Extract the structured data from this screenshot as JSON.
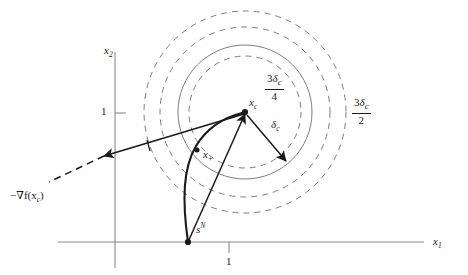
{
  "figure": {
    "type": "diagram",
    "width": 468,
    "height": 275,
    "background_color": "#ffffff",
    "ink_color": "#1a1a1a",
    "axis_color": "#8a8a8a",
    "circle_color": "#7d7d7d"
  },
  "axes": {
    "x_axis": {
      "label": "x",
      "label_sub": "1",
      "tick_label": "1"
    },
    "y_axis": {
      "label": "x",
      "label_sub": "2",
      "tick_label": "1"
    }
  },
  "points": {
    "center": {
      "name": "x_c",
      "label": "x",
      "label_sub": "c",
      "x": 245,
      "y": 112
    },
    "next_iterate": {
      "name": "x_plus",
      "label": "x",
      "label_sub": "+",
      "x": 201,
      "y": 160
    },
    "newton_point": {
      "name": "newton-step-endpoint",
      "x": 188,
      "y": 242
    }
  },
  "vectors": {
    "delta_c": {
      "label": "δ",
      "label_sub": "c",
      "description": "trust region radius arrow from x_c"
    },
    "neg_gradient": {
      "label": "−∇f(x",
      "label_sub": "c",
      "label_tail": ")",
      "description": "negative gradient / steepest descent direction arrow"
    },
    "newton_step": {
      "label": "s",
      "label_sup": "N",
      "description": "Newton step vector from x_c"
    }
  },
  "circles": [
    {
      "name": "delta-c-circle",
      "style": "dashed",
      "radius_label": "δc",
      "radius_px": 56
    },
    {
      "name": "three-delta-c-over-4-circle",
      "style": "solid",
      "numerator_coef": "3",
      "numerator_sym": "δ",
      "numerator_sub": "c",
      "denominator": "4",
      "radius_px": 67
    },
    {
      "name": "outer-guide-circle",
      "style": "dashed",
      "radius_px": 85
    },
    {
      "name": "three-delta-c-over-2-circle",
      "style": "dashed",
      "numerator_coef": "3",
      "numerator_sym": "δ",
      "numerator_sub": "c",
      "denominator": "2",
      "radius_px": 101
    }
  ],
  "labels": {
    "center_point": "x_c",
    "next_point": "x_+",
    "delta_c": "δ_c",
    "neg_gradient": "−∇f(x_c)",
    "newton_step": "s^N",
    "radius_3_4": "3δ_c / 4",
    "radius_3_2": "3δ_c / 2",
    "x_tick": "1",
    "y_tick": "1",
    "x_axis": "x_1",
    "y_axis": "x_2"
  }
}
